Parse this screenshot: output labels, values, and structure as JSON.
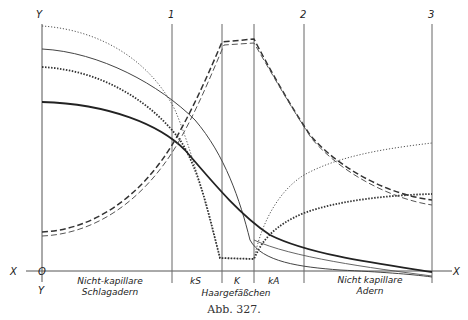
{
  "figure": {
    "caption": "Abb. 327.",
    "axis_labels": {
      "y_top": "Y",
      "y_bottom": "Y",
      "x_left": "X",
      "x_right": "X",
      "origin": "O"
    },
    "section_markers": [
      "1",
      "2",
      "3"
    ],
    "segment_labels": {
      "ks": "kS",
      "k": "K",
      "ka": "kA"
    },
    "region_labels": {
      "left_line1": "Nicht-kapillare",
      "left_line2": "Schlagadern",
      "middle": "Haargefäßchen",
      "right_line1": "Nicht kapillare",
      "right_line2": "Adern"
    }
  }
}
